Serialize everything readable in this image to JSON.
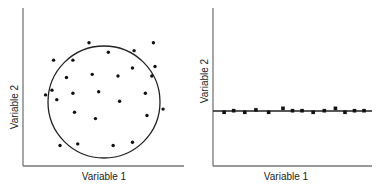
{
  "chart_data": [
    {
      "type": "scatter",
      "title": "",
      "xlabel": "Variable 1",
      "ylabel": "Variable 2",
      "grid": false,
      "legend": null,
      "annotation": "circle enclosing points (no correlation)",
      "circle": {
        "cx": 0.5,
        "cy": 0.5,
        "r": 0.35
      },
      "points": [
        [
          0.41,
          0.78
        ],
        [
          0.53,
          0.72
        ],
        [
          0.69,
          0.73
        ],
        [
          0.81,
          0.78
        ],
        [
          0.19,
          0.67
        ],
        [
          0.31,
          0.67
        ],
        [
          0.68,
          0.62
        ],
        [
          0.82,
          0.63
        ],
        [
          0.27,
          0.56
        ],
        [
          0.43,
          0.58
        ],
        [
          0.59,
          0.57
        ],
        [
          0.8,
          0.57
        ],
        [
          0.18,
          0.48
        ],
        [
          0.31,
          0.46
        ],
        [
          0.47,
          0.47
        ],
        [
          0.76,
          0.46
        ],
        [
          0.14,
          0.45
        ],
        [
          0.21,
          0.42
        ],
        [
          0.6,
          0.41
        ],
        [
          0.87,
          0.36
        ],
        [
          0.32,
          0.34
        ],
        [
          0.45,
          0.3
        ],
        [
          0.77,
          0.32
        ],
        [
          0.23,
          0.13
        ],
        [
          0.34,
          0.14
        ],
        [
          0.56,
          0.13
        ],
        [
          0.68,
          0.15
        ]
      ],
      "xlim": [
        0,
        1
      ],
      "ylim": [
        0,
        1
      ]
    },
    {
      "type": "scatter",
      "title": "",
      "xlabel": "Variable 1",
      "ylabel": "Variable 2",
      "grid": false,
      "legend": null,
      "annotation": "horizontal line through points (Variable 2 constant)",
      "line": {
        "y": 0.35
      },
      "points": [
        [
          0.07,
          0.34
        ],
        [
          0.13,
          0.35
        ],
        [
          0.2,
          0.34
        ],
        [
          0.27,
          0.355
        ],
        [
          0.35,
          0.34
        ],
        [
          0.44,
          0.365
        ],
        [
          0.5,
          0.35
        ],
        [
          0.56,
          0.35
        ],
        [
          0.63,
          0.34
        ],
        [
          0.7,
          0.35
        ],
        [
          0.77,
          0.365
        ],
        [
          0.83,
          0.34
        ],
        [
          0.89,
          0.35
        ],
        [
          0.95,
          0.35
        ]
      ],
      "xlim": [
        0,
        1
      ],
      "ylim": [
        0,
        1
      ]
    }
  ]
}
